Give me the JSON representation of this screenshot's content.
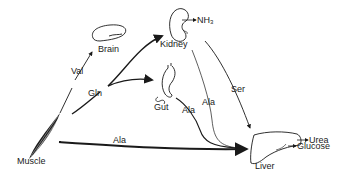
{
  "nodes": {
    "muscle": {
      "label": "Muscle"
    },
    "brain": {
      "label": "Brain"
    },
    "kidney": {
      "label": "Kidney"
    },
    "gut": {
      "label": "Gut"
    },
    "liver": {
      "label": "Liver"
    }
  },
  "edges": {
    "muscle_brain": {
      "label": "Val"
    },
    "muscle_gln": {
      "label": "Gln"
    },
    "muscle_liver": {
      "label": "Ala"
    },
    "kidney_liver_ala": {
      "label": "Ala"
    },
    "kidney_liver_ser": {
      "label": "Ser"
    },
    "gut_liver": {
      "label": "Ala"
    }
  },
  "outputs": {
    "kidney_nh3": {
      "label": "NH",
      "sub": "3"
    },
    "liver_urea": {
      "label": "Urea"
    },
    "liver_glucose": {
      "label": "Glucose"
    }
  },
  "colors": {
    "ink": "#1a1a1a",
    "background": "#ffffff"
  }
}
